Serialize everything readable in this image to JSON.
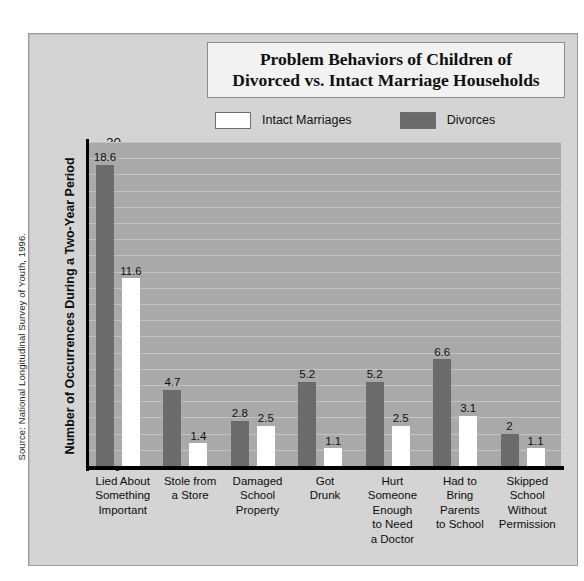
{
  "source": {
    "note": "Source: National Longitudinal Survey of Youth, 1996."
  },
  "title": {
    "line1": "Problem Behaviors of Children of",
    "line2": "Divorced vs. Intact Marriage Households"
  },
  "legend": {
    "position": "top-center",
    "items": [
      {
        "label": "Intact Marriages",
        "color": "#ffffff",
        "swatch": "intact-swatch"
      },
      {
        "label": "Divorces",
        "color": "#6b6b6b",
        "swatch": "divorces-swatch"
      }
    ]
  },
  "axes": {
    "y_title": "Number of Occurrences During a Two-Year Period",
    "y_ticks": [
      "0",
      "5",
      "10",
      "15",
      "20"
    ],
    "x_title": ""
  },
  "colors": {
    "panel_background": "#d4d4d4",
    "plot_background": "#a9a9a9",
    "gridline": "#c3c3c3",
    "axis": "#000000",
    "intact_bar": "#ffffff",
    "divorces_bar": "#6b6b6b",
    "title_box": "#f2f2f2"
  },
  "chart_data": {
    "type": "bar",
    "title": "Problem Behaviors of Children of Divorced vs. Intact Marriage Households",
    "xlabel": "",
    "ylabel": "Number of Occurrences During a Two-Year Period",
    "ylim": [
      0,
      20
    ],
    "yticks": [
      0,
      5,
      10,
      15,
      20
    ],
    "grid": true,
    "legend_position": "top-center",
    "categories": [
      "Lied About Something Important",
      "Stole from a Store",
      "Damaged School Property",
      "Got Drunk",
      "Hurt Someone Enough to Need a Doctor",
      "Had to Bring Parents to School",
      "Skipped School Without Permission"
    ],
    "category_lines": [
      [
        "Lied About",
        "Something",
        "Important"
      ],
      [
        "Stole from",
        "a Store"
      ],
      [
        "Damaged",
        "School",
        "Property"
      ],
      [
        "Got",
        "Drunk"
      ],
      [
        "Hurt",
        "Someone",
        "Enough",
        "to Need",
        "a Doctor"
      ],
      [
        "Had to",
        "Bring",
        "Parents",
        "to School"
      ],
      [
        "Skipped",
        "School",
        "Without",
        "Permission"
      ]
    ],
    "series": [
      {
        "name": "Divorces",
        "color": "#6b6b6b",
        "values": [
          18.6,
          4.7,
          2.8,
          5.2,
          5.2,
          6.6,
          2
        ],
        "labels": [
          "18.6",
          "4.7",
          "2.8",
          "5.2",
          "5.2",
          "6.6",
          "2"
        ]
      },
      {
        "name": "Intact Marriages",
        "color": "#ffffff",
        "values": [
          11.6,
          1.4,
          2.5,
          1.1,
          2.5,
          3.1,
          1.1
        ],
        "labels": [
          "11.6",
          "1.4",
          "2.5",
          "1.1",
          "2.5",
          "3.1",
          "1.1"
        ]
      }
    ]
  }
}
